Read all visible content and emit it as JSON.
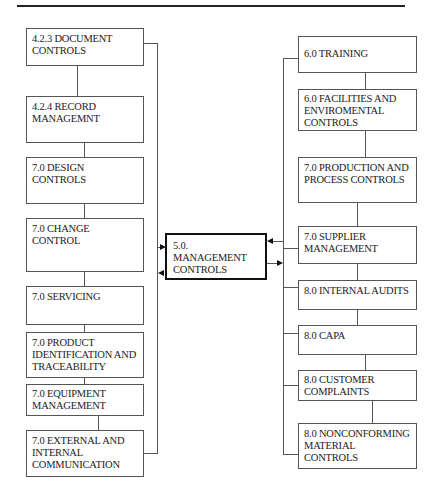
{
  "diagram": {
    "center": {
      "label": "5.0. MANAGEMENT CONTROLS"
    },
    "left_column": [
      {
        "label": "4.2.3 DOCUMENT CONTROLS"
      },
      {
        "label": "4.2.4 RECORD MANAGEMNT"
      },
      {
        "label": "7.0 DESIGN CONTROLS"
      },
      {
        "label": "7.0 CHANGE CONTROL"
      },
      {
        "label": "7.0 SERVICING"
      },
      {
        "label": "7.0 PRODUCT IDENTIFICATION AND TRACEABILITY"
      },
      {
        "label": "7.0 EQUIPMENT MANAGEMENT"
      },
      {
        "label": "7.0 EXTERNAL AND INTERNAL COMMUNICATION"
      }
    ],
    "right_column": [
      {
        "label": "6.0 TRAINING"
      },
      {
        "label": "6.0 FACILITIES AND ENVIROMENTAL CONTROLS"
      },
      {
        "label": "7.0 PRODUCTION AND PROCESS CONTROLS"
      },
      {
        "label": "7.0 SUPPLIER MANAGEMENT"
      },
      {
        "label": "8.0 INTERNAL AUDITS"
      },
      {
        "label": "8.0 CAPA"
      },
      {
        "label": "8.0 CUSTOMER COMPLAINTS"
      },
      {
        "label": "8.0 NONCONFORMING MATERIAL CONTROLS"
      }
    ],
    "colors": {
      "line": "#555555",
      "center_border": "#111111",
      "text": "#222222"
    }
  }
}
